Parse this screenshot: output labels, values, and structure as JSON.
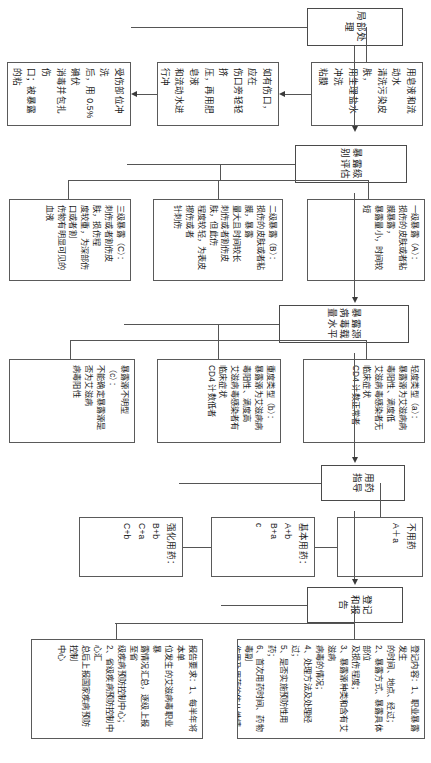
{
  "document": {
    "title": "艾滋病病毒职业暴露处理流程",
    "orientation": "rotated-90-ccw"
  },
  "stages": [
    {
      "id": "local-treatment",
      "header": "局部处理",
      "steps": [
        "用皂液和流动水\n清洗污染皮肤，\n用生理盐水冲洗\n粘膜",
        "如有伤口，应在\n伤口旁轻轻挤\n压，再用肥皂液\n和流动水进行冲\n洗；禁止进行局\n部按压",
        "受伤部位冲洗\n后，用 0.5%碘伏\n消毒并包扎伤\n口；被暴露的粘\n膜反复用生理盐\n水冲洗干净"
      ]
    },
    {
      "id": "exposure-level",
      "header": "暴露级别评估",
      "steps": [
        "一级暴露（A）：\n损伤的皮肤或者粘膜暴露，\n暴露量小，时间较短",
        "二级暴露（B）：\n损伤的皮肤或者粘膜，暴露\n量大且时间较长\n刺伤或者割伤皮肤，但此伤\n程度较轻，为表皮擦伤或者\n针刺伤",
        "三级暴露（C）：\n刺伤或者割伤皮肤，损伤程\n度较重，为深部伤口或者割\n伤物有明显可见的血液"
      ]
    },
    {
      "id": "viral-load",
      "header": "暴露源病毒载量水平",
      "steps": [
        "轻度类型（a）：\n暴露源为艾滋病病毒阳性、滴度低\n艾滋病毒感染者无临床症状\nCD4 计数正常者",
        "重度类型（b）：\n暴露源为艾滋病病毒阳性、滴度高\n艾滋病毒感染者有临床症状\nCD4 计数低者",
        "暴露源不明型（c）：\n不能确定暴露源是否为艾滋病\n病毒阳性"
      ]
    },
    {
      "id": "medication-guide",
      "header": "用药指导",
      "steps": [
        "不用药\nA＋a",
        "基本用药：\nA+b\nB+a\nc",
        "强化用药：\nB+b\nC+a\nC+b"
      ]
    },
    {
      "id": "registration-report",
      "header": "登记和报告",
      "steps": [
        "登记内容：1、职业暴露发生\n的时间、地点、经过；\n2、暴露方式、暴露具体部位\n及损伤程度；\n3、暴露源种类和含有艾滋病\n病毒的情况；\n4、处理方法及处理经过；\n5、是否实施预防性用药；\n6、首次用药时间、药物毒副\n作用及用药的依从性情况；\n7、定期检测及随访情况。",
        "报告要求：1、每半年将本单\n位发生的艾滋病毒职业暴\n露情况汇总，逐级上报至省\n级疾病预防控制中心；\n2、省级疾病预防控制中心汇\n总后上报国家疾病预防控制\n中心"
      ]
    }
  ],
  "colors": {
    "border": "#5a5a5a",
    "connector": "#555555",
    "background": "#ffffff",
    "text": "#1a1a1a"
  }
}
